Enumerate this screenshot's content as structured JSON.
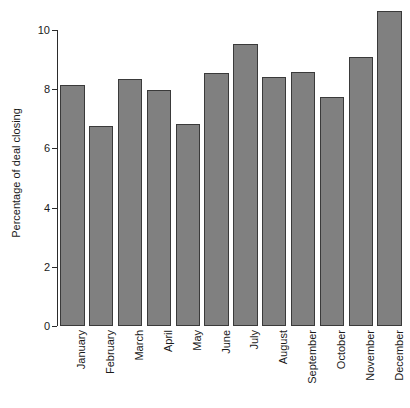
{
  "chart_data": {
    "type": "bar",
    "title": "",
    "subtitle": "",
    "xlabel": "",
    "ylabel": "Percentage of deal closing",
    "categories": [
      "January",
      "February",
      "March",
      "April",
      "May",
      "June",
      "July",
      "August",
      "September",
      "October",
      "November",
      "December"
    ],
    "values": [
      8.15,
      6.75,
      8.35,
      7.97,
      6.83,
      8.55,
      9.52,
      8.42,
      8.58,
      7.75,
      9.1,
      10.65
    ],
    "ylim": [
      0,
      10.9
    ],
    "yticks": [
      0,
      2,
      4,
      6,
      8,
      10
    ],
    "ytick_labels": [
      "0",
      "2",
      "4",
      "6",
      "8",
      "10"
    ],
    "grid": false,
    "legend": false,
    "legend_position": "none",
    "bar_color": "#808080",
    "bar_edge_color": "#3a3a3a",
    "axis_color": "#2b2b2b",
    "background_color": "#ffffff",
    "xtick_rotation": -90
  }
}
